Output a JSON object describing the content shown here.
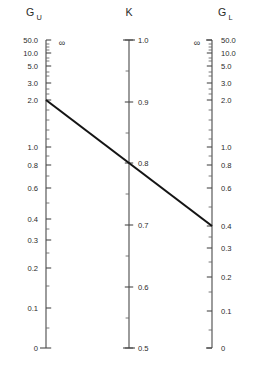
{
  "figure": {
    "type": "nomogram",
    "background": "#ffffff",
    "line_color": "#141414",
    "axis_color": "#4a4a4a",
    "width": 261,
    "height": 369
  },
  "axes": [
    {
      "id": "GU",
      "title": "G",
      "subscript": "U",
      "title_x": 30,
      "title_y": 16,
      "x": 46,
      "y_top": 40,
      "y_bottom": 348,
      "label_side": "left",
      "infinity_symbol": "∞",
      "infinity_x": 62,
      "infinity_y": 43,
      "cap_top": "none",
      "cap_bottom": "left",
      "major_ticks": [
        {
          "label": "50.0",
          "y": 40
        },
        {
          "label": "10.0",
          "y": 53
        },
        {
          "label": "5.0",
          "y": 66
        },
        {
          "label": "3.0",
          "y": 83
        },
        {
          "label": "2.0",
          "y": 100
        },
        {
          "label": "1.0",
          "y": 147
        },
        {
          "label": "0.8",
          "y": 165
        },
        {
          "label": "0.6",
          "y": 188
        },
        {
          "label": "0.4",
          "y": 219
        },
        {
          "label": "0.3",
          "y": 240
        },
        {
          "label": "0.2",
          "y": 268
        },
        {
          "label": "0.1",
          "y": 308
        },
        {
          "label": "0",
          "y": 348
        }
      ],
      "minor_ticks": [
        44,
        47,
        50,
        58,
        61,
        72,
        76,
        89,
        94,
        110,
        120,
        130,
        139,
        156,
        176,
        203,
        229,
        253,
        286,
        328
      ]
    },
    {
      "id": "K",
      "title": "K",
      "subscript": "",
      "title_x": 129,
      "title_y": 16,
      "x": 129,
      "y_top": 40,
      "y_bottom": 348,
      "label_side": "right",
      "infinity_symbol": "",
      "infinity_x": 0,
      "infinity_y": 0,
      "cap_top": "both",
      "cap_bottom": "both",
      "major_ticks": [
        {
          "label": "1.0",
          "y": 40
        },
        {
          "label": "0.9",
          "y": 102
        },
        {
          "label": "0.8",
          "y": 163
        },
        {
          "label": "0.7",
          "y": 225
        },
        {
          "label": "0.6",
          "y": 287
        },
        {
          "label": "0.5",
          "y": 348
        }
      ],
      "minor_ticks": [
        71,
        133,
        194,
        256,
        318
      ]
    },
    {
      "id": "GL",
      "title": "G",
      "subscript": "L",
      "title_x": 222,
      "title_y": 16,
      "x": 212,
      "y_top": 40,
      "y_bottom": 348,
      "label_side": "right",
      "infinity_symbol": "∞",
      "infinity_x": 197,
      "infinity_y": 43,
      "cap_top": "left",
      "cap_bottom": "left",
      "major_ticks": [
        {
          "label": "50.0",
          "y": 40
        },
        {
          "label": "10.0",
          "y": 53
        },
        {
          "label": "5.0",
          "y": 66
        },
        {
          "label": "3.0",
          "y": 83
        },
        {
          "label": "2.0",
          "y": 100
        },
        {
          "label": "1.0",
          "y": 147
        },
        {
          "label": "0.8",
          "y": 165
        },
        {
          "label": "0.6",
          "y": 188
        },
        {
          "label": "0.4",
          "y": 226
        },
        {
          "label": "0.3",
          "y": 248
        },
        {
          "label": "0.2",
          "y": 277
        },
        {
          "label": "0.1",
          "y": 311
        },
        {
          "label": "0",
          "y": 348
        }
      ],
      "minor_ticks": [
        44,
        47,
        50,
        58,
        61,
        72,
        76,
        89,
        94,
        110,
        120,
        130,
        139,
        156,
        176,
        207,
        237,
        262,
        292,
        330
      ]
    }
  ],
  "index_line": {
    "label": "index-line",
    "x1": 46,
    "y1": 100,
    "x2": 212,
    "y2": 226,
    "reading_GU": "2.0",
    "reading_K": "0.75",
    "reading_GL": "0.4"
  },
  "chart_data": {
    "type": "line",
    "title": "",
    "xlabel": "",
    "ylabel": "",
    "scales": [
      {
        "name": "G_U",
        "kind": "nonlinear-reciprocal",
        "tick_labels": [
          "50.0",
          "10.0",
          "5.0",
          "3.0",
          "2.0",
          "1.0",
          "0.8",
          "0.6",
          "0.4",
          "0.3",
          "0.2",
          "0.1",
          "0"
        ],
        "top_annotation": "∞",
        "range": [
          0,
          50
        ]
      },
      {
        "name": "K",
        "kind": "linear",
        "tick_labels": [
          "1.0",
          "0.9",
          "0.8",
          "0.7",
          "0.6",
          "0.5"
        ],
        "range": [
          0.5,
          1.0
        ]
      },
      {
        "name": "G_L",
        "kind": "nonlinear-reciprocal",
        "tick_labels": [
          "50.0",
          "10.0",
          "5.0",
          "3.0",
          "2.0",
          "1.0",
          "0.8",
          "0.6",
          "0.4",
          "0.3",
          "0.2",
          "0.1",
          "0"
        ],
        "top_annotation": "∞",
        "range": [
          0,
          50
        ]
      }
    ],
    "series": [
      {
        "name": "index line",
        "points": [
          {
            "axis": "G_U",
            "value": 2.0
          },
          {
            "axis": "K",
            "value": 0.75
          },
          {
            "axis": "G_L",
            "value": 0.4
          }
        ]
      }
    ]
  }
}
